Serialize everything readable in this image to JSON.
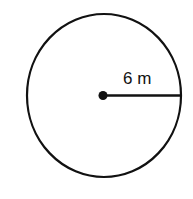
{
  "diagram": {
    "shape": "circle",
    "radius_label": "6 m",
    "colors": {
      "stroke": "#111111",
      "background": "#ffffff"
    }
  }
}
